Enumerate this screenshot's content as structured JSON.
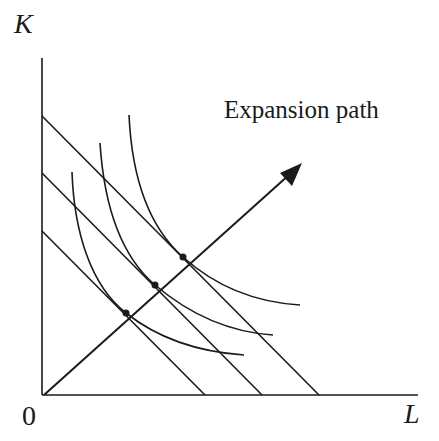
{
  "diagram": {
    "title": "Expansion path",
    "y_axis_label": "K",
    "x_axis_label": "L",
    "origin_label": "0",
    "expansion_path_label": "Expansion path",
    "line_color": "#1a1a1a",
    "elements": {
      "isocost_lines": [
        {
          "name": "isocost-1",
          "k_intercept_px": [
            42,
            231
          ],
          "l_intercept_px": [
            205,
            395
          ]
        },
        {
          "name": "isocost-2",
          "k_intercept_px": [
            42,
            173
          ],
          "l_intercept_px": [
            262,
            395
          ]
        },
        {
          "name": "isocost-3",
          "k_intercept_px": [
            42,
            116
          ],
          "l_intercept_px": [
            319,
            395
          ]
        }
      ],
      "isoquants": [
        {
          "name": "isoquant-1",
          "tangency_px": [
            126,
            313
          ]
        },
        {
          "name": "isoquant-2",
          "tangency_px": [
            155,
            285
          ]
        },
        {
          "name": "isoquant-3",
          "tangency_px": [
            183,
            257
          ]
        }
      ],
      "expansion_path": {
        "from_px": [
          44,
          395
        ],
        "to_px": [
          300,
          165
        ]
      }
    }
  }
}
